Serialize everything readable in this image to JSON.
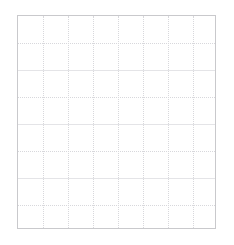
{
  "panel": {
    "title": "",
    "type": "empty-grid-panel",
    "background_color": "#ffffff"
  },
  "plot_area": {
    "x": 17,
    "y": 15,
    "width": 199,
    "height": 214,
    "border_color": "#c9c9cc",
    "border_width": 1,
    "background_color": "#ffffff"
  },
  "chart_data": {
    "type": "line",
    "title": "",
    "subtitle": "",
    "xlabel": "",
    "ylabel": "",
    "series": [],
    "categories": [],
    "x": [],
    "annotations": [],
    "legend": {
      "visible": false,
      "position": "none",
      "entries": []
    },
    "grid": {
      "visible": true,
      "color": "#d8d8dc",
      "style": "dotted",
      "vertical_lines": 7,
      "horizontal_lines": 7,
      "vertical_spacing_px": 25,
      "horizontal_spacing_px": 27
    },
    "xaxis": {
      "visible_ticks": false,
      "tick_labels": [],
      "line_color": "#c9c9cc"
    },
    "yaxis": {
      "visible_ticks": false,
      "tick_labels": [],
      "line_color": "#c9c9cc"
    }
  },
  "gridlines": {
    "vertical_positions": [
      25,
      50,
      75,
      100,
      125,
      150,
      175
    ],
    "horizontal_positions": [
      27,
      54,
      81,
      108,
      135,
      162,
      189
    ],
    "horizontal_major": [
      1,
      3,
      5
    ]
  }
}
